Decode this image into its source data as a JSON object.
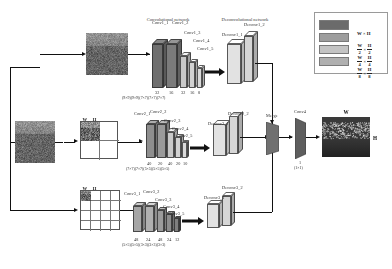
{
  "figure": {
    "sections": {
      "conv_net": "Convolutional network",
      "deconv_net": "Deconvolutional network"
    }
  },
  "input": {
    "source_label": "",
    "scales": [
      {
        "id": "scale-1",
        "label_w": "W",
        "label_h": "H",
        "times": "×",
        "grid": 1
      },
      {
        "id": "scale-2",
        "label_w": "W",
        "label_h": "H",
        "den_w": "2",
        "den_h": "2",
        "times": "×",
        "grid": 2
      },
      {
        "id": "scale-3",
        "label_w": "W",
        "label_h": "H",
        "den_w": "4",
        "den_h": "4",
        "times": "×",
        "grid": 4
      }
    ]
  },
  "branches": [
    {
      "id": "branch-1",
      "conv_labels": [
        "Conv1_1",
        "Conv1_2",
        "Conv1_3",
        "Conv1_4",
        "Conv1_5"
      ],
      "channels": [
        "32",
        "16",
        "32",
        "16",
        "8"
      ],
      "kernels": "(9×9)(9×9)(7×7)(7×7)(7×7)",
      "deconv_labels": [
        "Deconv1_1",
        "Deconv1_2"
      ]
    },
    {
      "id": "branch-2",
      "conv_labels": [
        "Conv2_1",
        "Conv2_2",
        "Conv2_3",
        "Conv2_4",
        "Conv2_5"
      ],
      "channels": [
        "40",
        "20",
        "40",
        "20",
        "10"
      ],
      "kernels": "(7×7)(7×7)(5×5)(5×5)(5×5)",
      "deconv_labels": [
        "Deconv2_1",
        "Deconv2_2"
      ]
    },
    {
      "id": "branch-3",
      "conv_labels": [
        "Conv3_1",
        "Conv3_2",
        "Conv3_3",
        "Conv3_4",
        "Conv3_5"
      ],
      "channels": [
        "48",
        "24",
        "48",
        "24",
        "12"
      ],
      "kernels": "(5×5)(5×5)(3×3)(3×3)(3×3)",
      "deconv_labels": [
        "Deconv3_1",
        "Deconv3_2"
      ]
    }
  ],
  "merge": {
    "label": "Merge"
  },
  "conv4": {
    "label": "Conv4",
    "channels": "1",
    "kernel": "(1×1)"
  },
  "output": {
    "label_w": "W",
    "label_h": "H",
    "caption": ""
  },
  "legend": {
    "entries": [
      {
        "swatch": "#6b6b6b",
        "num_w": "W",
        "num_h": "H",
        "den_w": "",
        "den_h": "",
        "times": "×"
      },
      {
        "swatch": "#9d9d9d",
        "num_w": "W",
        "num_h": "H",
        "den_w": "2",
        "den_h": "2",
        "times": "×"
      },
      {
        "swatch": "#c4c4c4",
        "num_w": "W",
        "num_h": "H",
        "den_w": "4",
        "den_h": "4",
        "times": "×"
      },
      {
        "swatch": "#b0b0b0",
        "num_w": "W",
        "num_h": "H",
        "den_w": "8",
        "den_h": "8",
        "times": "×"
      }
    ]
  },
  "colors": {
    "dark_gray": "#6b6b6b",
    "mid_gray": "#9d9d9d",
    "light_gray": "#c7c7c7",
    "pale_gray": "#dcdcdc",
    "line": "#111111"
  }
}
